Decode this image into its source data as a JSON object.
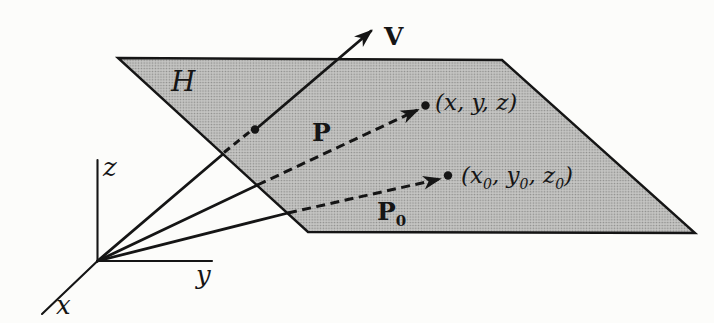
{
  "colors": {
    "background": "#fcfcfa",
    "line": "#151515",
    "plane_base": "#c6c6c4",
    "plane_dot": "#8a8a88"
  },
  "labels": {
    "plane": "H",
    "vector_v": "V",
    "vector_p": "P",
    "vector_p0": {
      "base": "P",
      "sub": "0"
    },
    "point": "(x, y, z)",
    "point0_parts": [
      "(x",
      "0",
      ", y",
      "0",
      ", z",
      "0",
      ")"
    ],
    "axis_x": "x",
    "axis_y": "y",
    "axis_z": "z"
  }
}
